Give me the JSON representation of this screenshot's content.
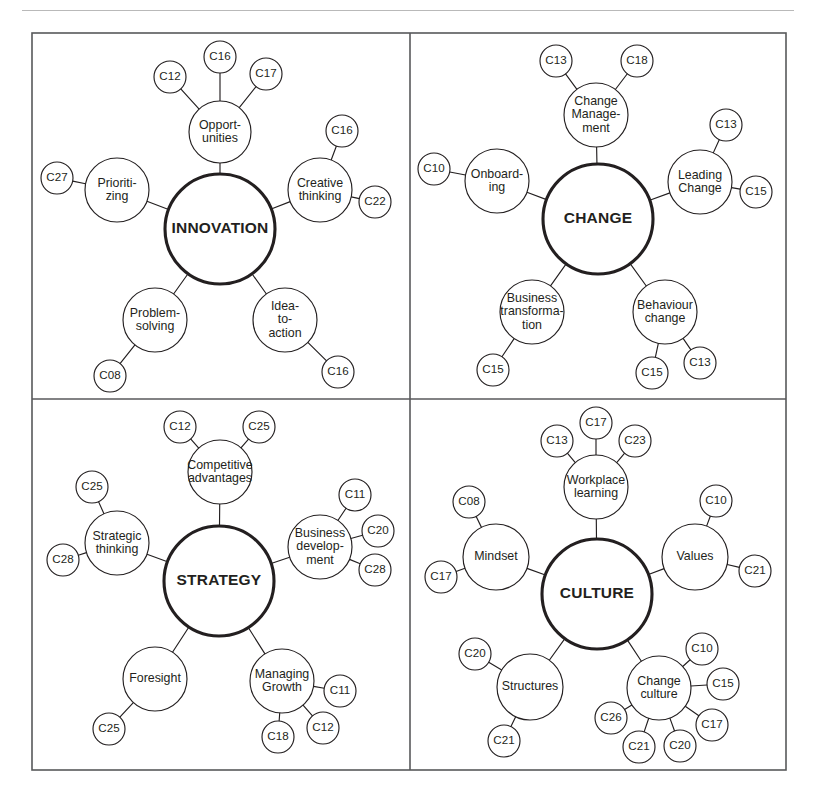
{
  "figure": {
    "background_color": "#ffffff",
    "ink_color": "#231f20",
    "frame_color": "#58595b",
    "rule_color": "#b9b9b9",
    "frame": {
      "x": 32,
      "y": 33,
      "width": 754,
      "height": 737
    },
    "dividers": {
      "vertical_x": 410,
      "horizontal_y": 399
    }
  },
  "chart_data": {
    "type": "diagram",
    "diagram_type": "radial-mind-map-grid",
    "title": "",
    "panel_count": 4,
    "panels": [
      {
        "id": "innovation",
        "hub": "INNOVATION",
        "hub_center": [
          220,
          229
        ],
        "hub_radius": 55,
        "branches": [
          {
            "label": "Opport-\nunities",
            "lines": [
              "Opport-",
              "unities"
            ],
            "center": [
              220,
              132
            ],
            "radius": 31,
            "leaves": [
              {
                "label": "C12",
                "center": [
                  170,
                  77
                ],
                "radius": 16
              },
              {
                "label": "C16",
                "center": [
                  220,
                  57
                ],
                "radius": 16
              },
              {
                "label": "C17",
                "center": [
                  266,
                  74
                ],
                "radius": 16
              }
            ]
          },
          {
            "label": "Creative\nthinking",
            "lines": [
              "Creative",
              "thinking"
            ],
            "center": [
              320,
              190
            ],
            "radius": 32,
            "leaves": [
              {
                "label": "C16",
                "center": [
                  342,
                  131
                ],
                "radius": 16
              },
              {
                "label": "C22",
                "center": [
                  375,
                  202
                ],
                "radius": 16
              }
            ]
          },
          {
            "label": "Idea-\nto-\naction",
            "lines": [
              "Idea-",
              "to-",
              "action"
            ],
            "center": [
              285,
              320
            ],
            "radius": 32,
            "leaves": [
              {
                "label": "C16",
                "center": [
                  338,
                  372
                ],
                "radius": 16
              }
            ]
          },
          {
            "label": "Problem-\nsolving",
            "lines": [
              "Problem-",
              "solving"
            ],
            "center": [
              155,
              320
            ],
            "radius": 32,
            "leaves": [
              {
                "label": "C08",
                "center": [
                  110,
                  376
                ],
                "radius": 16
              }
            ]
          },
          {
            "label": "Prioriti-\nzing",
            "lines": [
              "Prioriti-",
              "zing"
            ],
            "center": [
              117,
              190
            ],
            "radius": 32,
            "leaves": [
              {
                "label": "C27",
                "center": [
                  57,
                  178
                ],
                "radius": 16
              }
            ]
          }
        ]
      },
      {
        "id": "change",
        "hub": "CHANGE",
        "hub_center": [
          598,
          219
        ],
        "hub_radius": 55,
        "branches": [
          {
            "label": "Change\nManage-\nment",
            "lines": [
              "Change",
              "Manage-",
              "ment"
            ],
            "center": [
              596,
              115
            ],
            "radius": 32,
            "leaves": [
              {
                "label": "C13",
                "center": [
                  556,
                  61
                ],
                "radius": 16
              },
              {
                "label": "C18",
                "center": [
                  637,
                  61
                ],
                "radius": 16
              }
            ]
          },
          {
            "label": "Leading\nChange",
            "lines": [
              "Leading",
              "Change"
            ],
            "center": [
              700,
              182
            ],
            "radius": 32,
            "leaves": [
              {
                "label": "C13",
                "center": [
                  726,
                  125
                ],
                "radius": 16
              },
              {
                "label": "C15",
                "center": [
                  756,
                  192
                ],
                "radius": 16
              }
            ]
          },
          {
            "label": "Behaviour\nchange",
            "lines": [
              "Behaviour",
              "change"
            ],
            "center": [
              665,
              312
            ],
            "radius": 32,
            "leaves": [
              {
                "label": "C15",
                "center": [
                  652,
                  373
                ],
                "radius": 16
              },
              {
                "label": "C13",
                "center": [
                  700,
                  363
                ],
                "radius": 16
              }
            ]
          },
          {
            "label": "Business\ntransforma-\ntion",
            "lines": [
              "Business",
              "transforma-",
              "tion"
            ],
            "center": [
              532,
              312
            ],
            "radius": 32,
            "leaves": [
              {
                "label": "C15",
                "center": [
                  493,
                  370
                ],
                "radius": 16
              }
            ]
          },
          {
            "label": "Onboard-\ning",
            "lines": [
              "Onboard-",
              "ing"
            ],
            "center": [
              497,
              181
            ],
            "radius": 32,
            "leaves": [
              {
                "label": "C10",
                "center": [
                  434,
                  169
                ],
                "radius": 16
              }
            ]
          }
        ]
      },
      {
        "id": "strategy",
        "hub": "STRATEGY",
        "hub_center": [
          219,
          581
        ],
        "hub_radius": 55,
        "branches": [
          {
            "label": "Competitive\nadvantages",
            "lines": [
              "Competitive",
              "advantages"
            ],
            "center": [
              220,
              472
            ],
            "radius": 32,
            "leaves": [
              {
                "label": "C12",
                "center": [
                  180,
                  427
                ],
                "radius": 16
              },
              {
                "label": "C25",
                "center": [
                  259,
                  427
                ],
                "radius": 16
              }
            ]
          },
          {
            "label": "Business\ndevelop-\nment",
            "lines": [
              "Business",
              "develop-",
              "ment"
            ],
            "center": [
              320,
              547
            ],
            "radius": 32,
            "leaves": [
              {
                "label": "C11",
                "center": [
                  355,
                  495
                ],
                "radius": 16
              },
              {
                "label": "C20",
                "center": [
                  378,
                  531
                ],
                "radius": 16
              },
              {
                "label": "C28",
                "center": [
                  375,
                  570
                ],
                "radius": 16
              }
            ]
          },
          {
            "label": "Managing\nGrowth",
            "lines": [
              "Managing",
              "Growth"
            ],
            "center": [
              282,
              681
            ],
            "radius": 32,
            "leaves": [
              {
                "label": "C11",
                "center": [
                  340,
                  691
                ],
                "radius": 16
              },
              {
                "label": "C12",
                "center": [
                  323,
                  728
                ],
                "radius": 16
              },
              {
                "label": "C18",
                "center": [
                  278,
                  737
                ],
                "radius": 16
              }
            ]
          },
          {
            "label": "Foresight",
            "lines": [
              "Foresight"
            ],
            "center": [
              155,
              679
            ],
            "radius": 32,
            "leaves": [
              {
                "label": "C25",
                "center": [
                  109,
                  729
                ],
                "radius": 16
              }
            ]
          },
          {
            "label": "Strategic\nthinking",
            "lines": [
              "Strategic",
              "thinking"
            ],
            "center": [
              117,
              543
            ],
            "radius": 32,
            "leaves": [
              {
                "label": "C25",
                "center": [
                  92,
                  487
                ],
                "radius": 16
              },
              {
                "label": "C28",
                "center": [
                  63,
                  560
                ],
                "radius": 16
              }
            ]
          }
        ]
      },
      {
        "id": "culture",
        "hub": "CULTURE",
        "hub_center": [
          597,
          594
        ],
        "hub_radius": 55,
        "branches": [
          {
            "label": "Workplace\nlearning",
            "lines": [
              "Workplace",
              "learning"
            ],
            "center": [
              596,
              487
            ],
            "radius": 32,
            "leaves": [
              {
                "label": "C13",
                "center": [
                  557,
                  441
                ],
                "radius": 16
              },
              {
                "label": "C17",
                "center": [
                  596,
                  423
                ],
                "radius": 16
              },
              {
                "label": "C23",
                "center": [
                  635,
                  441
                ],
                "radius": 16
              }
            ]
          },
          {
            "label": "Values",
            "lines": [
              "Values"
            ],
            "center": [
              695,
              557
            ],
            "radius": 33,
            "leaves": [
              {
                "label": "C10",
                "center": [
                  716,
                  501
                ],
                "radius": 16
              },
              {
                "label": "C21",
                "center": [
                  755,
                  571
                ],
                "radius": 16
              }
            ]
          },
          {
            "label": "Change\nculture",
            "lines": [
              "Change",
              "culture"
            ],
            "center": [
              659,
              688
            ],
            "radius": 32,
            "leaves": [
              {
                "label": "C10",
                "center": [
                  702,
                  649
                ],
                "radius": 16
              },
              {
                "label": "C15",
                "center": [
                  723,
                  684
                ],
                "radius": 16
              },
              {
                "label": "C17",
                "center": [
                  712,
                  725
                ],
                "radius": 16
              },
              {
                "label": "C20",
                "center": [
                  680,
                  746
                ],
                "radius": 16
              },
              {
                "label": "C21",
                "center": [
                  639,
                  747
                ],
                "radius": 16
              },
              {
                "label": "C26",
                "center": [
                  611,
                  718
                ],
                "radius": 16
              }
            ]
          },
          {
            "label": "Structures",
            "lines": [
              "Structures"
            ],
            "center": [
              530,
              687
            ],
            "radius": 33,
            "leaves": [
              {
                "label": "C20",
                "center": [
                  475,
                  654
                ],
                "radius": 16
              },
              {
                "label": "C21",
                "center": [
                  504,
                  741
                ],
                "radius": 16
              }
            ]
          },
          {
            "label": "Mindset",
            "lines": [
              "Mindset"
            ],
            "center": [
              496,
              557
            ],
            "radius": 33,
            "leaves": [
              {
                "label": "C08",
                "center": [
                  469,
                  502
                ],
                "radius": 16
              },
              {
                "label": "C17",
                "center": [
                  441,
                  577
                ],
                "radius": 16
              }
            ]
          }
        ]
      }
    ]
  }
}
